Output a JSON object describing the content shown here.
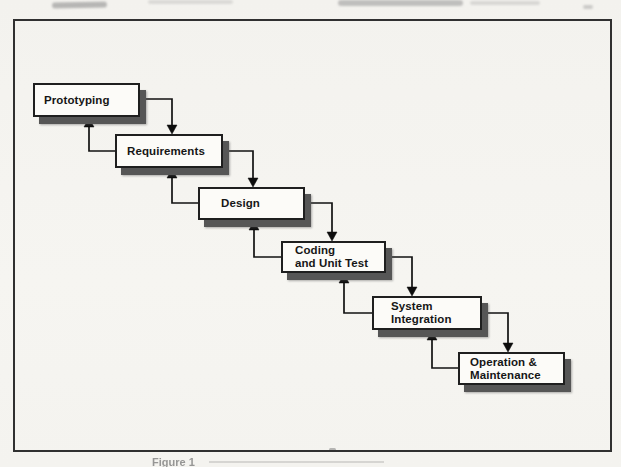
{
  "colors": {
    "paper": "#f4f3ef",
    "ink": "#1b1b1b",
    "box_fill": "#fcfbf8",
    "box_border": "#1f1f1f",
    "box_shadow": "#565656",
    "arrow": "#121212",
    "frame_border": "#303030"
  },
  "diagram": {
    "type": "flow-diagram",
    "boxes": [
      {
        "name": "prototyping",
        "lines": [
          "Prototyping"
        ]
      },
      {
        "name": "requirements",
        "lines": [
          "Requirements"
        ]
      },
      {
        "name": "design",
        "lines": [
          "Design"
        ]
      },
      {
        "name": "coding-and-unit-test",
        "lines": [
          "Coding",
          "and Unit Test"
        ]
      },
      {
        "name": "system-integration",
        "lines": [
          "System",
          "Integration"
        ]
      },
      {
        "name": "operation-maintenance",
        "lines": [
          "Operation &",
          "Maintenance"
        ]
      }
    ],
    "connections": [
      {
        "from": "Prototyping",
        "to": "Requirements",
        "direction": "forward"
      },
      {
        "from": "Requirements",
        "to": "Prototyping",
        "direction": "feedback"
      },
      {
        "from": "Requirements",
        "to": "Design",
        "direction": "forward"
      },
      {
        "from": "Design",
        "to": "Requirements",
        "direction": "feedback"
      },
      {
        "from": "Design",
        "to": "Coding and Unit Test",
        "direction": "forward"
      },
      {
        "from": "Coding and Unit Test",
        "to": "Design",
        "direction": "feedback"
      },
      {
        "from": "Coding and Unit Test",
        "to": "System Integration",
        "direction": "forward"
      },
      {
        "from": "System Integration",
        "to": "Coding and Unit Test",
        "direction": "feedback"
      },
      {
        "from": "System Integration",
        "to": "Operation & Maintenance",
        "direction": "forward"
      },
      {
        "from": "Operation & Maintenance",
        "to": "System Integration",
        "direction": "feedback"
      }
    ],
    "caption_fragment": "Figure 1"
  }
}
